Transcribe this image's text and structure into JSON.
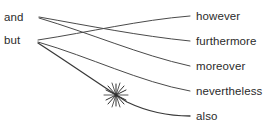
{
  "diagram": {
    "type": "bipartite-link-diagram",
    "title": "",
    "canvas": {
      "width": 263,
      "height": 131,
      "background": "#ffffff"
    },
    "style": {
      "edge_color": "#4a4a4a",
      "edge_width": 1.0,
      "text_color": "#2b2b2b",
      "marker_color": "#2f2f2f"
    },
    "left_nodes": [
      {
        "id": "and",
        "label": "and",
        "x": 4,
        "y": 11,
        "anchor_x": 39,
        "anchor_y": 17
      },
      {
        "id": "but",
        "label": "but",
        "x": 4,
        "y": 34,
        "anchor_x": 38,
        "anchor_y": 41
      }
    ],
    "right_nodes": [
      {
        "id": "however",
        "label": "however",
        "x": 196,
        "y": 10,
        "anchor_x": 190,
        "anchor_y": 16
      },
      {
        "id": "furthermore",
        "label": "furthermore",
        "x": 196,
        "y": 35,
        "anchor_x": 190,
        "anchor_y": 41
      },
      {
        "id": "moreover",
        "label": "moreover",
        "x": 196,
        "y": 60,
        "anchor_x": 190,
        "anchor_y": 66
      },
      {
        "id": "nevertheless",
        "label": "nevertheless",
        "x": 196,
        "y": 85,
        "anchor_x": 190,
        "anchor_y": 91
      },
      {
        "id": "also",
        "label": "also",
        "x": 196,
        "y": 110,
        "anchor_x": 190,
        "anchor_y": 116
      }
    ],
    "edges": [
      {
        "id": "and-furthermore",
        "from": "and",
        "to": "furthermore",
        "marked": false
      },
      {
        "id": "and-moreover",
        "from": "and",
        "to": "moreover",
        "marked": false
      },
      {
        "id": "but-however",
        "from": "but",
        "to": "however",
        "marked": false
      },
      {
        "id": "but-nevertheless",
        "from": "but",
        "to": "nevertheless",
        "marked": false
      },
      {
        "id": "but-also",
        "from": "but",
        "to": "also",
        "marked": true
      }
    ],
    "markers": [
      {
        "id": "burst-marker",
        "shape": "star-burst",
        "on_edge": "but-also",
        "x": 116,
        "y": 95,
        "radius": 12
      }
    ]
  }
}
